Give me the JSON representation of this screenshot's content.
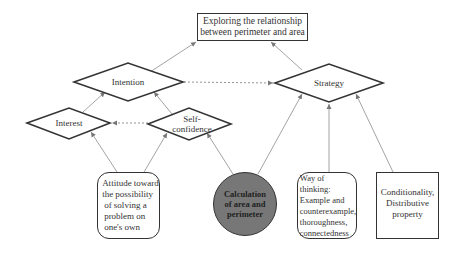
{
  "diagram": {
    "title_box": {
      "label_line1": "Exploring the relationship",
      "label_line2": "between perimeter and area"
    },
    "diamonds": {
      "intention": "Intention",
      "strategy": "Strategy",
      "interest": "Interest",
      "self_confidence_line1": "Self-",
      "self_confidence_line2": "confidence"
    },
    "bottom_nodes": {
      "attitude": [
        "Attitude toward",
        "the possibility",
        "of solving a",
        "problem on",
        "one's  own"
      ],
      "calculation": [
        "Calculation",
        "of area and",
        "perimeter"
      ],
      "way_of_thinking": [
        "Way of thinking:",
        "Example and",
        "counterexample,",
        "thoroughness,",
        "connectedness"
      ],
      "conditionality": [
        "Conditionality,",
        "Distributive",
        "property"
      ]
    },
    "colors": {
      "stroke": "#333333",
      "arrow": "#888888",
      "circle_fill": "#777777",
      "background": "#ffffff"
    },
    "edges": [
      {
        "from": "Intention",
        "to": "Exploring the relationship between perimeter and area",
        "style": "solid"
      },
      {
        "from": "Strategy",
        "to": "Exploring the relationship between perimeter and area",
        "style": "solid"
      },
      {
        "from": "Intention",
        "to": "Strategy",
        "style": "dashed"
      },
      {
        "from": "Self-confidence",
        "to": "Interest",
        "style": "dashed"
      },
      {
        "from": "Interest",
        "to": "Intention",
        "style": "solid"
      },
      {
        "from": "Self-confidence",
        "to": "Intention",
        "style": "solid"
      },
      {
        "from": "Attitude toward the possibility of solving a problem on one's own",
        "to": "Interest",
        "style": "solid"
      },
      {
        "from": "Attitude toward the possibility of solving a problem on one's own",
        "to": "Self-confidence",
        "style": "solid"
      },
      {
        "from": "Calculation of area and perimeter",
        "to": "Self-confidence",
        "style": "solid"
      },
      {
        "from": "Calculation of area and perimeter",
        "to": "Strategy",
        "style": "solid"
      },
      {
        "from": "Way of thinking",
        "to": "Strategy",
        "style": "solid"
      },
      {
        "from": "Conditionality, Distributive property",
        "to": "Strategy",
        "style": "solid"
      }
    ]
  }
}
